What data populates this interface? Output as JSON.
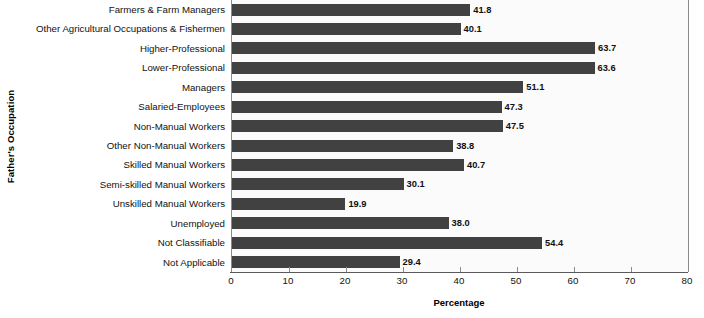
{
  "chart_data": {
    "type": "bar",
    "orientation": "horizontal",
    "title": "",
    "xlabel": "Percentage",
    "ylabel": "Father's Occupation",
    "xlim": [
      0,
      80
    ],
    "xticks": [
      0,
      10,
      20,
      30,
      40,
      50,
      60,
      70,
      80
    ],
    "grid": false,
    "legend": null,
    "bar_color": "#414141",
    "categories": [
      "Farmers & Farm Managers",
      "Other Agricultural Occupations & Fishermen",
      "Higher-Professional",
      "Lower-Professional",
      "Managers",
      "Salaried-Employees",
      "Non-Manual Workers",
      "Other Non-Manual Workers",
      "Skilled Manual Workers",
      "Semi-skilled Manual Workers",
      "Unskilled Manual Workers",
      "Unemployed",
      "Not Classifiable",
      "Not Applicable"
    ],
    "values": [
      41.8,
      40.1,
      63.7,
      63.6,
      51.1,
      47.3,
      47.5,
      38.8,
      40.7,
      30.1,
      19.9,
      38.0,
      54.4,
      29.4
    ],
    "value_labels": [
      "41.8",
      "40.1",
      "63.7",
      "63.6",
      "51.1",
      "47.3",
      "47.5",
      "38.8",
      "40.7",
      "30.1",
      "19.9",
      "38.0",
      "54.4",
      "29.4"
    ],
    "xtick_labels": [
      "0",
      "10",
      "20",
      "30",
      "40",
      "50",
      "60",
      "70",
      "80"
    ]
  }
}
